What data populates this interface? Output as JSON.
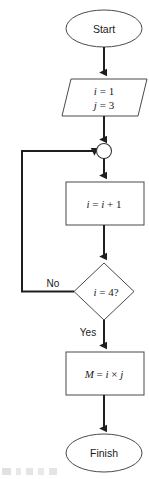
{
  "diagram": {
    "type": "flowchart",
    "nodes": [
      {
        "id": "start",
        "shape": "terminator",
        "label": "Start"
      },
      {
        "id": "input",
        "shape": "parallelogram",
        "line1_var": "i",
        "line1_rest": " = 1",
        "line2_var": "j",
        "line2_rest": " = 3"
      },
      {
        "id": "junction",
        "shape": "connector-circle",
        "label": ""
      },
      {
        "id": "increment",
        "shape": "process",
        "part1_var": "i",
        "part2_op": " = ",
        "part3_var": "i",
        "part4_rest": " + 1"
      },
      {
        "id": "decision",
        "shape": "diamond",
        "cond_var": "i",
        "cond_rest": " = 4?"
      },
      {
        "id": "compute",
        "shape": "process",
        "lhs_var": "M",
        "eq": " = ",
        "rhs_var1": "i",
        "times": " × ",
        "rhs_var2": "j"
      },
      {
        "id": "finish",
        "shape": "terminator",
        "label": "Finish"
      }
    ],
    "branches": {
      "no_label": "No",
      "yes_label": "Yes"
    },
    "colors": {
      "shape_stroke": "#4a4a4a",
      "line": "#1f1f1f",
      "text": "#1a1a1a",
      "background": "#ffffff"
    }
  }
}
